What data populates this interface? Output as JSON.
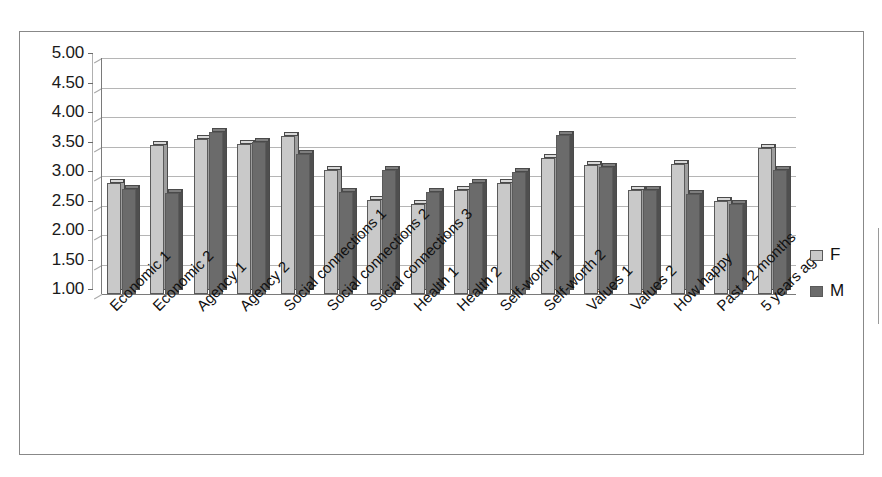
{
  "chart_data": {
    "type": "bar",
    "title": "",
    "subtitle": "",
    "xlabel": "",
    "ylabel": "",
    "ylim": [
      1.0,
      5.0
    ],
    "ytick_step": 0.5,
    "ytick_labels": [
      "5.00",
      "4.50",
      "4.00",
      "3.50",
      "3.00",
      "2.50",
      "2.00",
      "1.50",
      "1.00"
    ],
    "grid": true,
    "legend_position": "right",
    "style": "3d-excel",
    "categories": [
      "Economic 1",
      "Economic 2",
      "Agency 1",
      "Agency 2",
      "Social connections 1",
      "Social connections 2",
      "Social connections 3",
      "Health 1",
      "Health 2",
      "Self-worth 1",
      "Self-worth 2",
      "Values 1",
      "Values 2",
      "How happy",
      "Past 12 months",
      "5 years ago"
    ],
    "series": [
      {
        "name": "F",
        "color": "#c9c9c9",
        "values": [
          2.88,
          3.53,
          3.62,
          3.55,
          3.68,
          3.1,
          2.6,
          2.53,
          2.77,
          2.88,
          3.3,
          3.18,
          2.77,
          3.2,
          2.57,
          3.47
        ]
      },
      {
        "name": "M",
        "color": "#6b6b6b",
        "values": [
          2.78,
          2.72,
          3.75,
          3.58,
          3.37,
          2.73,
          3.1,
          2.73,
          2.88,
          3.07,
          3.7,
          3.15,
          2.77,
          2.7,
          2.52,
          3.1
        ]
      }
    ]
  },
  "legend": {
    "items": [
      {
        "label": "F",
        "color": "#c9c9c9"
      },
      {
        "label": "M",
        "color": "#6b6b6b"
      }
    ]
  },
  "colors": {
    "series_f": "#c9c9c9",
    "series_m": "#6b6b6b",
    "gridline": "#b5b5b5",
    "axis": "#7a7a7a",
    "border": "#888888",
    "text": "#111111"
  }
}
